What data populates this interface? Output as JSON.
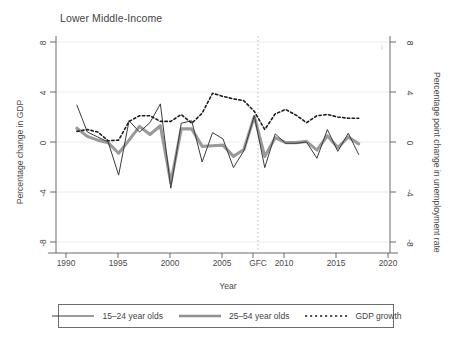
{
  "chart_data": {
    "type": "line",
    "title": "Lower Middle-Income",
    "xlabel": "Year",
    "ylabel": "Percentage change in GDP",
    "y2label": "Percentage point change in unemployment rate",
    "xlim": [
      1989,
      2021
    ],
    "ylim": [
      -8,
      8
    ],
    "y2lim": [
      -8,
      8
    ],
    "grid": "horizontal-light",
    "legend_position": "bottom",
    "xticks": [
      "1990",
      "1995",
      "2000",
      "2005",
      "GFC",
      "2010",
      "2015",
      "2020"
    ],
    "xtick_values": [
      1990,
      1995,
      2000,
      2005,
      2008,
      2010,
      2015,
      2020
    ],
    "yticks": [
      "8",
      "4",
      "0",
      "-4",
      "-8"
    ],
    "ytick_values": [
      8,
      4,
      0,
      -4,
      -8
    ],
    "y2ticks": [
      "8",
      "4",
      "0",
      "-4",
      "-8"
    ],
    "y2tick_values": [
      8,
      4,
      0,
      -4,
      -8
    ],
    "annotations": [
      {
        "name": "gfc-marker",
        "label": "GFC",
        "x": 2008,
        "style": "vertical-dotted-line"
      }
    ],
    "x": [
      1991,
      1992,
      1993,
      1994,
      1995,
      1996,
      1997,
      1998,
      1999,
      2000,
      2001,
      2002,
      2003,
      2004,
      2005,
      2006,
      2007,
      2008,
      2009,
      2010,
      2011,
      2012,
      2013,
      2014,
      2015,
      2016,
      2017,
      2018
    ],
    "series": [
      {
        "name": "15–24 year olds",
        "axis": "left",
        "style": "solid-thin",
        "color": "#3b3b3b",
        "values": [
          5.9,
          1.6,
          0.8,
          0.0,
          -5.3,
          3.4,
          1.6,
          3.1,
          6.1,
          -7.4,
          3.0,
          3.4,
          -3.2,
          1.5,
          0.5,
          -4.1,
          -1.4,
          4.2,
          -4.1,
          1.3,
          -0.2,
          -0.2,
          0.0,
          -2.6,
          2.0,
          -1.5,
          1.4,
          -2.0
        ]
      },
      {
        "name": "25–54 year olds",
        "axis": "left",
        "style": "solid-thick",
        "color": "#9a9a9a",
        "values": [
          2.2,
          0.9,
          0.3,
          -0.1,
          -1.8,
          0.3,
          2.5,
          1.2,
          2.6,
          -6.5,
          2.1,
          2.1,
          -0.7,
          -0.6,
          -0.5,
          -2.3,
          -1.2,
          4.1,
          -2.3,
          0.7,
          -0.1,
          -0.1,
          0.1,
          -1.3,
          1.0,
          -0.9,
          0.8,
          -0.3
        ]
      },
      {
        "name": "GDP growth",
        "axis": "right",
        "style": "dotted",
        "color": "#1c1c1c",
        "values": [
          1.7,
          2.0,
          1.6,
          0.2,
          0.3,
          3.3,
          4.2,
          4.2,
          3.3,
          3.3,
          4.4,
          3.0,
          4.6,
          7.8,
          7.3,
          6.9,
          6.6,
          4.9,
          2.0,
          4.5,
          5.2,
          4.3,
          3.1,
          4.2,
          4.4,
          4.0,
          3.8,
          3.8
        ]
      }
    ]
  },
  "legend": {
    "entries": [
      {
        "label": "15–24 year olds",
        "icon": "solid-thin-line-icon"
      },
      {
        "label": "25–54 year olds",
        "icon": "solid-thick-line-icon"
      },
      {
        "label": "GDP growth",
        "icon": "dotted-line-icon"
      }
    ]
  }
}
